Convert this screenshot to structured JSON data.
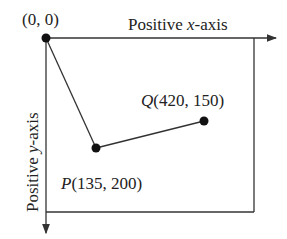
{
  "diagram": {
    "origin_label": "(0, 0)",
    "x_axis_label_pre": "Positive ",
    "x_axis_label_var": "x",
    "x_axis_label_post": "-axis",
    "y_axis_label_pre": "Positive ",
    "y_axis_label_var": "y",
    "y_axis_label_post": "-axis",
    "point_p": {
      "name": "P",
      "coords": "(135, 200)"
    },
    "point_q": {
      "name": "Q",
      "coords": "(420, 150)"
    },
    "line_color": "#333333"
  }
}
